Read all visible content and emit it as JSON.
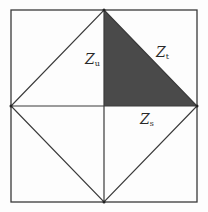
{
  "diagram": {
    "outer_square": {
      "x1": 11,
      "y1": 10,
      "x2": 197,
      "y2": 202
    },
    "center": {
      "x": 104,
      "y": 106
    },
    "vertices": {
      "top_mid": {
        "x": 104,
        "y": 10
      },
      "right_mid": {
        "x": 197,
        "y": 106
      },
      "bottom_mid": {
        "x": 104,
        "y": 202
      },
      "left_mid": {
        "x": 11,
        "y": 106
      }
    },
    "colors": {
      "stroke": "#3a3a3a",
      "shaded_fill": "#4a4a4a",
      "background": "#fdfdfd"
    },
    "shaded_region": {
      "name": "upper-right-inner-triangle",
      "points": "104,10 104,106 197,106"
    },
    "labels": [
      {
        "id": "zu",
        "main": "Z",
        "sub": "u",
        "x": 85,
        "y": 52
      },
      {
        "id": "zt",
        "main": "Z",
        "sub": "t",
        "x": 156,
        "y": 45
      },
      {
        "id": "zs",
        "main": "Z",
        "sub": "s",
        "x": 140,
        "y": 112
      }
    ]
  }
}
